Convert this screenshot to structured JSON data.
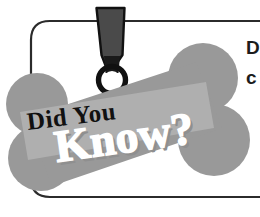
{
  "graphic": {
    "type": "did-you-know-callout",
    "headline_top": "Did You",
    "headline_bottom": "Know?",
    "tag_icon_name": "dog-tag-icon",
    "bone_icon_name": "dog-bone-icon",
    "ring_icon_name": "o-ring-icon",
    "border_icon_name": "rounded-callout-border"
  },
  "body_copy": {
    "line1": "D",
    "line2": "c"
  },
  "colors": {
    "bone_gray": "#999999",
    "banner_gray": "#b3b3b3",
    "strap_dark": "#4a4a4a",
    "strap_darker": "#1a1a1a",
    "ring_black": "#111111",
    "border_line": "#2b2b2b",
    "headline_top_color": "#111111",
    "headline_bottom_color": "#ffffff",
    "headline_shadow": "#8f8f8f",
    "background": "#ffffff"
  }
}
